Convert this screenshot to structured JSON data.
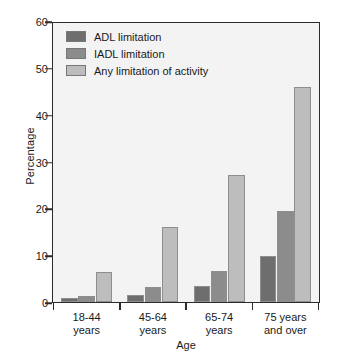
{
  "chart_data": {
    "type": "bar",
    "title": "",
    "xlabel": "Age",
    "ylabel": "Percentage",
    "categories": [
      "18-44 years",
      "45-64 years",
      "65-74 years",
      "75 years and over"
    ],
    "category_lines": [
      [
        "18-44",
        "years"
      ],
      [
        "45-64",
        "years"
      ],
      [
        "65-74",
        "years"
      ],
      [
        "75 years",
        "and over"
      ]
    ],
    "series": [
      {
        "name": "ADL limitation",
        "color": "#6e6e6e",
        "values": [
          0.8,
          1.4,
          3.4,
          9.8
        ]
      },
      {
        "name": "IADL limitation",
        "color": "#8c8c8c",
        "values": [
          1.2,
          3.1,
          6.6,
          19.6
        ]
      },
      {
        "name": "Any limitation of activity",
        "color": "#bdbdbd",
        "values": [
          6.4,
          16.1,
          27.3,
          46.2
        ]
      }
    ],
    "ylim": [
      0,
      60
    ],
    "yticks": [
      0,
      10,
      20,
      30,
      40,
      50,
      60
    ],
    "ytick_labels": [
      "0",
      "10",
      "20",
      "30",
      "40",
      "50",
      "60"
    ],
    "grid": false,
    "legend_position": "top-left",
    "plot_background": "#f3f3f3",
    "frame_color": "#2b2b2b"
  }
}
